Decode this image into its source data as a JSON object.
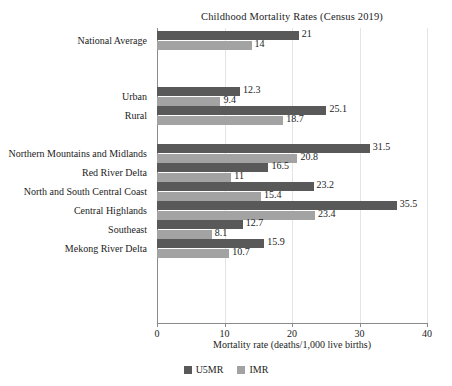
{
  "chart_data": {
    "type": "bar",
    "orientation": "horizontal",
    "title": "Childhood Mortality Rates (Census 2019)",
    "xlabel": "Mortality rate (deaths/1,000 live births)",
    "ylabel": "",
    "xlim": [
      0,
      40
    ],
    "xticks": [
      0,
      10,
      20,
      30,
      40
    ],
    "xtick_labels": [
      "0",
      "10",
      "20",
      "30",
      "40"
    ],
    "grid": true,
    "grid_axis": "x",
    "legend_position": "bottom",
    "categories": [
      "National Average",
      "Urban",
      "Rural",
      "Northern Mountains and Midlands",
      "Red River Delta",
      "North and South Central Coast",
      "Central Highlands",
      "Southeast",
      "Mekong River Delta"
    ],
    "groups": [
      {
        "name": "overall",
        "categories": [
          "National Average"
        ]
      },
      {
        "name": "residence",
        "categories": [
          "Urban",
          "Rural"
        ]
      },
      {
        "name": "region",
        "categories": [
          "Northern Mountains and Midlands",
          "Red River Delta",
          "North and South Central Coast",
          "Central Highlands",
          "Southeast",
          "Mekong River Delta"
        ]
      }
    ],
    "series": [
      {
        "name": "U5MR",
        "color": "#595959",
        "values": [
          21,
          12.3,
          25.1,
          31.5,
          16.5,
          23.2,
          35.5,
          12.7,
          15.9
        ],
        "value_labels": [
          "21",
          "12.3",
          "25.1",
          "31.5",
          "16.5",
          "23.2",
          "35.5",
          "12.7",
          "15.9"
        ]
      },
      {
        "name": "IMR",
        "color": "#a3a3a3",
        "values": [
          14,
          9.4,
          18.7,
          20.8,
          11,
          15.4,
          23.4,
          8.1,
          10.7
        ],
        "value_labels": [
          "14",
          "9.4",
          "18.7",
          "20.8",
          "11",
          "15.4",
          "23.4",
          "8.1",
          "10.7"
        ]
      }
    ],
    "legend": [
      {
        "label": "U5MR",
        "color": "#595959"
      },
      {
        "label": "IMR",
        "color": "#a3a3a3"
      }
    ]
  }
}
